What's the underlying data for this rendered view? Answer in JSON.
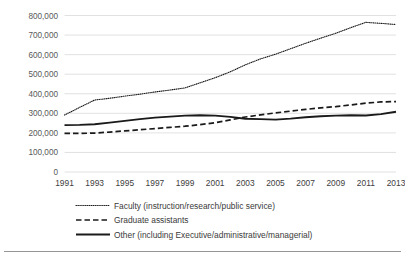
{
  "chart_data": {
    "type": "line",
    "title": "",
    "subtitle": "",
    "xlabel": "",
    "ylabel": "",
    "xlim": [
      1991,
      2013
    ],
    "ylim": [
      0,
      800000
    ],
    "grid": true,
    "legend_position": "bottom",
    "y_ticks": [
      0,
      100000,
      200000,
      300000,
      400000,
      500000,
      600000,
      700000,
      800000
    ],
    "y_tick_labels": [
      "0",
      "100,000",
      "200,000",
      "300,000",
      "400,000",
      "500,000",
      "600,000",
      "700,000",
      "800,000"
    ],
    "x_ticks": [
      1991,
      1993,
      1995,
      1997,
      1999,
      2001,
      2003,
      2005,
      2007,
      2009,
      2011,
      2013
    ],
    "x_tick_labels": [
      "1991",
      "1993",
      "1995",
      "1997",
      "1999",
      "2001",
      "2003",
      "2005",
      "2007",
      "2009",
      "2011",
      "2013"
    ],
    "x": [
      1991,
      1992,
      1993,
      1994,
      1995,
      1996,
      1997,
      1998,
      1999,
      2000,
      2001,
      2002,
      2003,
      2004,
      2005,
      2006,
      2007,
      2008,
      2009,
      2010,
      2011,
      2012,
      2013
    ],
    "series": [
      {
        "name": "Faculty (instruction/research/public service)",
        "style": "dotted",
        "color": "#1a1a1a",
        "values": [
          291000,
          330000,
          368000,
          377000,
          388000,
          398000,
          409000,
          419000,
          430000,
          456000,
          482000,
          512000,
          548000,
          578000,
          602000,
          630000,
          658000,
          684000,
          709000,
          738000,
          765000,
          760000,
          754000
        ]
      },
      {
        "name": "Graduate assistants",
        "style": "dashed",
        "color": "#1a1a1a",
        "values": [
          197000,
          197000,
          199000,
          204000,
          210000,
          216000,
          222000,
          228000,
          234000,
          242000,
          252000,
          266000,
          281000,
          292000,
          302000,
          311000,
          320000,
          328000,
          334000,
          343000,
          352000,
          358000,
          360000
        ]
      },
      {
        "name": "Other (including Executive/administrative/managerial)",
        "style": "solid",
        "color": "#1a1a1a",
        "values": [
          240000,
          241000,
          244000,
          252000,
          261000,
          270000,
          278000,
          283000,
          288000,
          290000,
          288000,
          282000,
          272000,
          270000,
          268000,
          273000,
          280000,
          285000,
          288000,
          290000,
          289000,
          296000,
          308000
        ]
      }
    ]
  },
  "legend": {
    "items": [
      {
        "label": "Faculty (instruction/research/public service)",
        "style": "dotted"
      },
      {
        "label": "Graduate assistants",
        "style": "dashed"
      },
      {
        "label": "Other (including Executive/administrative/managerial)",
        "style": "solid"
      }
    ]
  },
  "colors": {
    "gridline": "#d9d9d9",
    "line": "#1a1a1a",
    "tick_text": "#595959",
    "background": "#ffffff"
  }
}
